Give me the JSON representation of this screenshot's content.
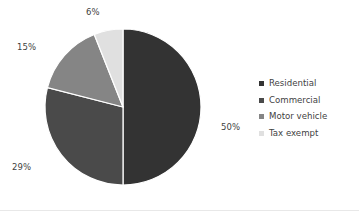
{
  "chart_data": {
    "type": "pie",
    "title": "",
    "subtitle": "",
    "xlabel": "",
    "ylabel": "",
    "grid": false,
    "legend_position": "right",
    "start_angle_deg": 0,
    "direction": "clockwise",
    "categories": [
      "Residential",
      "Commercial",
      "Motor vehicle",
      "Tax exempt"
    ],
    "values": [
      50,
      29,
      15,
      6
    ],
    "unit": "%",
    "data_labels": [
      "50%",
      "29%",
      "15%",
      "6%"
    ],
    "colors": [
      "#333333",
      "#4a4a4a",
      "#858585",
      "#e0e0e0"
    ],
    "slices": [
      {
        "label": "Residential",
        "value": 50,
        "data_label": "50%",
        "color": "#333333"
      },
      {
        "label": "Commercial",
        "value": 29,
        "data_label": "29%",
        "color": "#4a4a4a"
      },
      {
        "label": "Motor vehicle",
        "value": 15,
        "data_label": "15%",
        "color": "#858585"
      },
      {
        "label": "Tax exempt",
        "value": 6,
        "data_label": "6%",
        "color": "#e0e0e0"
      }
    ]
  },
  "legend": {
    "items": [
      {
        "label": "Residential",
        "color": "#333333"
      },
      {
        "label": "Commercial",
        "color": "#4a4a4a"
      },
      {
        "label": "Motor vehicle",
        "color": "#858585"
      },
      {
        "label": "Tax exempt",
        "color": "#e0e0e0"
      }
    ]
  },
  "style": {
    "background": "#ffffff",
    "slice_border": "#ffffff",
    "text_color": "#3f3f3f",
    "rule_color": "#e8e8e8"
  }
}
